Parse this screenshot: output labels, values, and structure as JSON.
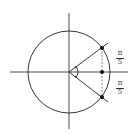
{
  "diagram": {
    "type": "unit-circle-angle",
    "colors": {
      "stroke": "#222222",
      "dashed": "#555555",
      "background": "#ffffff"
    },
    "labels": {
      "upper_fraction": {
        "numerator": "π",
        "denominator": "5"
      },
      "lower_fraction": {
        "numerator": "π",
        "denominator": "5"
      }
    },
    "points": [
      {
        "name": "upper-intersection",
        "x": 102,
        "y": 48
      },
      {
        "name": "axis-foot",
        "x": 102,
        "y": 72
      },
      {
        "name": "lower-intersection",
        "x": 102,
        "y": 97
      }
    ]
  }
}
